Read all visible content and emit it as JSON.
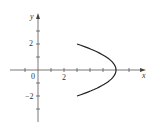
{
  "chart_data": {
    "type": "line",
    "title": "",
    "xlabel": "x",
    "ylabel": "y",
    "xlim": [
      -2,
      7
    ],
    "ylim": [
      -4,
      4
    ],
    "grid": false,
    "x_tick_labels": [
      {
        "value": 0,
        "label": "0"
      },
      {
        "value": 2,
        "label": "2"
      }
    ],
    "y_tick_labels": [
      {
        "value": 2,
        "label": "2"
      },
      {
        "value": -2,
        "label": "−2"
      }
    ],
    "x_ticks": [
      -1,
      1,
      2,
      3,
      4,
      5,
      7
    ],
    "y_ticks": [
      3,
      2,
      1,
      -1,
      -2,
      -3
    ],
    "series": [
      {
        "name": "curve",
        "description": "left-opening parabola arc x = 6 - 0.75*y^2 for y in [-2, 2]",
        "points": [
          [
            3,
            2
          ],
          [
            4.125,
            1.5
          ],
          [
            5.25,
            1
          ],
          [
            5.8125,
            0.5
          ],
          [
            6,
            0
          ],
          [
            5.8125,
            -0.5
          ],
          [
            5.25,
            -1
          ],
          [
            4.125,
            -1.5
          ],
          [
            3,
            -2
          ]
        ]
      }
    ],
    "colors": {
      "axis": "#555555",
      "curve": "#222222"
    }
  },
  "labels": {
    "x_axis": "x",
    "y_axis": "y",
    "origin": "0",
    "x_two": "2",
    "y_two": "2",
    "y_neg_two": "−2"
  }
}
